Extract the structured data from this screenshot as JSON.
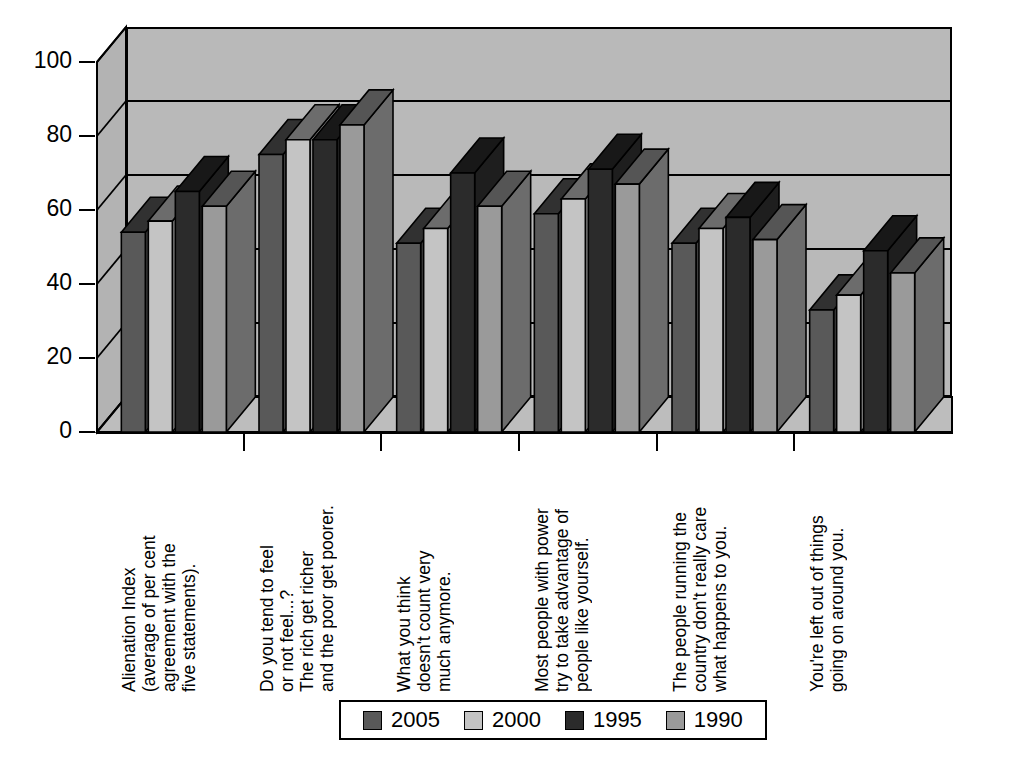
{
  "chart_data": {
    "type": "bar",
    "title": "",
    "xlabel": "",
    "ylabel": "",
    "ylim": [
      0,
      100
    ],
    "yticks": [
      0,
      20,
      40,
      60,
      80,
      100
    ],
    "grid": true,
    "legend_position": "bottom",
    "three_d": true,
    "categories": [
      "Alienation Index\n(average of per cent\nagreement with the\nfive statements).",
      "Do you tend to feel\nor not feel...?\nThe rich get richer\nand the poor get poorer.",
      "What you think\ndoesn't count very\nmuch anymore.",
      "Most people with power\ntry to take advantage of\npeople like yourself.",
      "The people running the\ncountry don't really care\nwhat happens to you.",
      "You're left out of things\ngoing on around you."
    ],
    "series": [
      {
        "name": "2005",
        "color": "#595959",
        "values": [
          54,
          75,
          51,
          59,
          51,
          33
        ]
      },
      {
        "name": "2000",
        "color": "#c4c4c4",
        "values": [
          57,
          79,
          55,
          63,
          55,
          37
        ]
      },
      {
        "name": "1995",
        "color": "#2b2b2b",
        "values": [
          65,
          79,
          70,
          71,
          58,
          49
        ]
      },
      {
        "name": "1990",
        "color": "#9a9a9a",
        "values": [
          61,
          83,
          61,
          67,
          52,
          43
        ]
      }
    ]
  },
  "legend": {
    "items": [
      {
        "label": "2005",
        "color": "#595959"
      },
      {
        "label": "2000",
        "color": "#c4c4c4"
      },
      {
        "label": "1995",
        "color": "#2b2b2b"
      },
      {
        "label": "1990",
        "color": "#9a9a9a"
      }
    ]
  },
  "axis": {
    "y_tick_labels": [
      "100",
      "80",
      "60",
      "40",
      "20",
      "0"
    ]
  },
  "colors": {
    "plot_background": "#b9b9b9",
    "floor": "#bdbdbd",
    "left_wall": "#b3b3b3",
    "outline": "#000000",
    "page_background": "#ffffff"
  }
}
